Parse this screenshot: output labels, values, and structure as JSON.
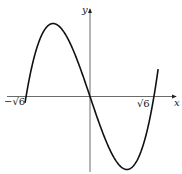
{
  "chart_data": {
    "type": "line",
    "title": "",
    "xlabel": "x",
    "ylabel": "y",
    "function": "y = x^3 - 6x (shape)",
    "x_ticks": [
      {
        "value": -2.449,
        "label": "−√6"
      },
      {
        "value": 2.449,
        "label": "√6"
      }
    ],
    "key_points": {
      "x_intercepts": [
        -2.449,
        0,
        2.449
      ],
      "local_max": {
        "x": -1.414,
        "y": 5.657
      },
      "local_min": {
        "x": 1.414,
        "y": -5.657
      }
    },
    "xlim": [
      -3.2,
      3.3
    ],
    "ylim": [
      -5.9,
      6.6
    ],
    "grid": false,
    "legend": "none",
    "colors": {
      "curve": "#111111",
      "axes": "#333333"
    }
  },
  "labels": {
    "x_axis": "x",
    "y_axis": "y",
    "neg_root": "−√6",
    "pos_root": "√6"
  }
}
